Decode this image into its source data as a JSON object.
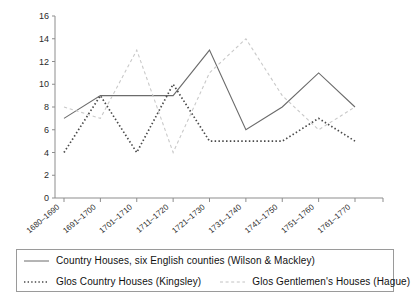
{
  "chart_data": {
    "type": "line",
    "title": "",
    "xlabel": "",
    "ylabel": "",
    "ylim": [
      0,
      16
    ],
    "yticks": [
      0,
      2,
      4,
      6,
      8,
      10,
      12,
      14,
      16
    ],
    "grid": false,
    "legend_position": "bottom",
    "categories": [
      "1680–1690",
      "1691–1700",
      "1701–1710",
      "1711–1720",
      "1721–1730",
      "1731–1740",
      "1741–1750",
      "1751–1760",
      "1761–1770"
    ],
    "series": [
      {
        "name": "Country Houses, six  English counties (Wilson & Mackley)",
        "style": "solid",
        "color": "#6b6b6b",
        "values": [
          7,
          9,
          9,
          9,
          13,
          6,
          8,
          11,
          8
        ]
      },
      {
        "name": "Glos Country Houses (Kingsley)",
        "style": "dotted",
        "color": "#4a4a4a",
        "values": [
          4,
          9,
          4,
          10,
          5,
          5,
          5,
          7,
          5
        ]
      },
      {
        "name": "Glos Gentlemen's Houses (Hague)",
        "style": "dashed",
        "color": "#c9c9c9",
        "values": [
          8,
          7,
          13,
          4,
          11,
          14,
          9,
          6,
          8
        ]
      }
    ]
  },
  "legend": {
    "entries": [
      {
        "label": "Country Houses, six  English counties (Wilson & Mackley)"
      },
      {
        "label": "Glos Country Houses (Kingsley)"
      },
      {
        "label": "Glos Gentlemen's Houses (Hague)"
      }
    ]
  },
  "colors": {
    "axis": "#8d8d8d",
    "text": "#1a1a1a",
    "legend_border": "#9a9a9a",
    "background": "#ffffff"
  }
}
